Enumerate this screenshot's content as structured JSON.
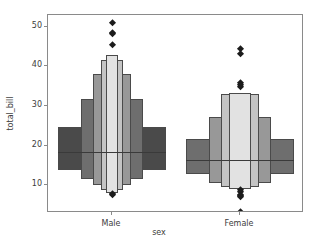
{
  "chart_data": {
    "type": "boxen",
    "title": "",
    "xlabel": "sex",
    "ylabel": "total_bill",
    "categories": [
      "Male",
      "Female"
    ],
    "xtick_labels": [
      "Male",
      "Female"
    ],
    "ytick_labels": [
      "10",
      "20",
      "30",
      "40",
      "50"
    ],
    "ytick_values": [
      10,
      20,
      30,
      40,
      50
    ],
    "ylim": [
      3.0,
      53.0
    ],
    "grid": false,
    "legend": null,
    "series": [
      {
        "name": "Male",
        "median": 18.35,
        "boxes": [
          {
            "level": 1,
            "lower": 13.8,
            "upper": 24.7,
            "width_frac": 1.0,
            "fill": "#4a4a4a"
          },
          {
            "level": 2,
            "lower": 11.6,
            "upper": 31.8,
            "width_frac": 0.58,
            "fill": "#6e6e6e"
          },
          {
            "level": 3,
            "lower": 10.0,
            "upper": 38.2,
            "width_frac": 0.36,
            "fill": "#989898"
          },
          {
            "level": 4,
            "lower": 8.9,
            "upper": 41.6,
            "width_frac": 0.2,
            "fill": "#c4c4c4"
          },
          {
            "level": 5,
            "lower": 8.0,
            "upper": 43.0,
            "width_frac": 0.11,
            "fill": "#e2e2e2"
          }
        ],
        "outliers": [
          50.8,
          48.3,
          48.0,
          45.4,
          7.3,
          7.6
        ]
      },
      {
        "name": "Female",
        "median": 16.4,
        "boxes": [
          {
            "level": 1,
            "lower": 12.8,
            "upper": 21.6,
            "width_frac": 1.0,
            "fill": "#6e6e6e"
          },
          {
            "level": 2,
            "lower": 10.5,
            "upper": 27.2,
            "width_frac": 0.58,
            "fill": "#989898"
          },
          {
            "level": 3,
            "lower": 9.6,
            "upper": 33.1,
            "width_frac": 0.36,
            "fill": "#c4c4c4"
          },
          {
            "level": 4,
            "lower": 9.0,
            "upper": 33.3,
            "width_frac": 0.2,
            "fill": "#e2e2e2"
          }
        ],
        "outliers": [
          44.3,
          43.1,
          35.8,
          35.2,
          34.8,
          8.6,
          8.1,
          7.5,
          7.2,
          6.8,
          3.1
        ]
      }
    ],
    "colors": {
      "box_edge": "#4a4a4a",
      "median_line": "#3a3a3a",
      "outlier": "#1c1c1c",
      "axis": "#8a8a8a",
      "text": "#3c3c3c",
      "background": "#ffffff"
    }
  }
}
